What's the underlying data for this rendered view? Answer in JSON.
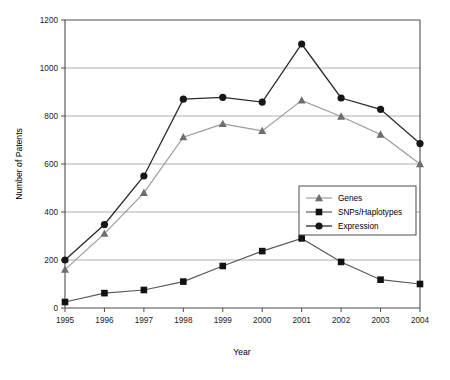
{
  "chart_data": {
    "type": "line",
    "title": "",
    "xlabel": "Year",
    "ylabel": "Number of Patents",
    "categories": [
      "1995",
      "1996",
      "1997",
      "1998",
      "1999",
      "2000",
      "2001",
      "2002",
      "2003",
      "2004"
    ],
    "x": [
      1995,
      1996,
      1997,
      1998,
      1999,
      2000,
      2001,
      2002,
      2003,
      2004
    ],
    "xlim": [
      1995,
      2004
    ],
    "ylim": [
      0,
      1200
    ],
    "yticks": [
      0,
      200,
      400,
      600,
      800,
      1000,
      1200
    ],
    "ytick_labels": [
      "0",
      "200",
      "400",
      "600",
      "800",
      "1000",
      "1200"
    ],
    "grid": "horizontal",
    "legend_position": "inside-lower-right",
    "series": [
      {
        "name": "Genes",
        "marker": "triangle",
        "color": "#6e6e6e",
        "values": [
          160,
          310,
          480,
          712,
          767,
          738,
          865,
          798,
          723,
          600
        ]
      },
      {
        "name": "SNPs/Haplotypes",
        "marker": "square",
        "color": "#111111",
        "values": [
          25,
          62,
          75,
          110,
          175,
          237,
          290,
          192,
          118,
          100
        ]
      },
      {
        "name": "Expression",
        "marker": "circle",
        "color": "#161616",
        "values": [
          200,
          348,
          550,
          870,
          878,
          858,
          1100,
          875,
          828,
          685
        ]
      }
    ]
  },
  "legend": {
    "entries": [
      {
        "label": "Genes"
      },
      {
        "label": "SNPs/Haplotypes"
      },
      {
        "label": "Expression"
      }
    ]
  }
}
